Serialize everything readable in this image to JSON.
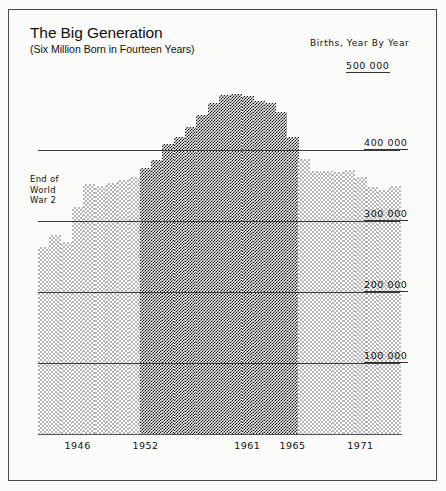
{
  "header": {
    "title": "The Big Generation",
    "subtitle": "(Six Million Born in Fourteen Years)",
    "legend_title": "Births, Year By Year",
    "top_value": "500 000"
  },
  "annotation": {
    "line1": "End of",
    "line2": "World",
    "line3": "War 2"
  },
  "chart_data": {
    "type": "bar",
    "title": "The Big Generation",
    "subtitle": "(Six Million Born in Fourteen Years)",
    "xlabel": "",
    "ylabel": "Births, Year By Year",
    "ylim": [
      0,
      500000
    ],
    "grid": true,
    "legend_position": "none",
    "gridlines": [
      100000,
      200000,
      300000,
      400000,
      500000
    ],
    "gridline_labels": [
      "100 000",
      "200 000",
      "300 000",
      "400 000",
      "500 000"
    ],
    "tick_labels": [
      "1946",
      "1952",
      "1961",
      "1965",
      "1971"
    ],
    "tick_years": [
      1946,
      1952,
      1961,
      1965,
      1971
    ],
    "highlight_range": [
      1952,
      1965
    ],
    "highlight_label": "Six Million Born in Fourteen Years",
    "annotation_text": "End of World War 2",
    "annotation_year": 1945,
    "categories": [
      1943,
      1944,
      1945,
      1946,
      1947,
      1948,
      1949,
      1950,
      1951,
      1952,
      1953,
      1954,
      1955,
      1956,
      1957,
      1958,
      1959,
      1960,
      1961,
      1962,
      1963,
      1964,
      1965,
      1966,
      1967,
      1968,
      1969,
      1970,
      1971,
      1972,
      1973,
      1974
    ],
    "values": [
      263000,
      281000,
      270000,
      320000,
      352000,
      350000,
      353000,
      358000,
      362000,
      374000,
      386000,
      408000,
      418000,
      433000,
      450000,
      466000,
      478000,
      479000,
      476000,
      469000,
      466000,
      453000,
      419000,
      388000,
      371000,
      370000,
      369000,
      372000,
      362000,
      348000,
      344000,
      350000
    ]
  }
}
